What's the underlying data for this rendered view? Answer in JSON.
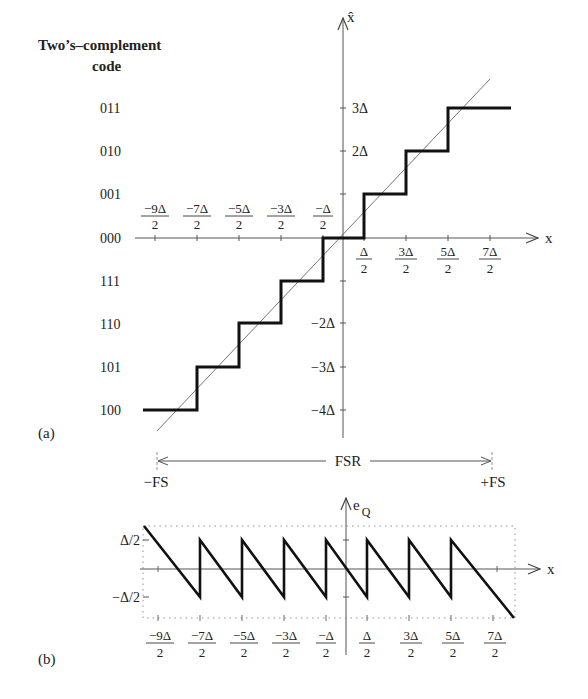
{
  "panel_a": {
    "label": "(a)",
    "title_line1": "Two’s–complement",
    "title_line2": "code",
    "y_axis_label": "x̂",
    "x_axis_label": "x",
    "codes": [
      "011",
      "010",
      "001",
      "000",
      "111",
      "110",
      "101",
      "100"
    ],
    "y_ticks_pos": [
      "3Δ",
      "2Δ"
    ],
    "y_ticks_neg": [
      "−2Δ",
      "−3Δ",
      "−4Δ"
    ],
    "x_ticks_neg": [
      {
        "num": "−9Δ",
        "den": "2"
      },
      {
        "num": "−7Δ",
        "den": "2"
      },
      {
        "num": "−5Δ",
        "den": "2"
      },
      {
        "num": "−3Δ",
        "den": "2"
      },
      {
        "num": "−Δ",
        "den": "2"
      }
    ],
    "x_ticks_pos": [
      {
        "num": "Δ",
        "den": "2"
      },
      {
        "num": "3Δ",
        "den": "2"
      },
      {
        "num": "5Δ",
        "den": "2"
      },
      {
        "num": "7Δ",
        "den": "2"
      }
    ]
  },
  "range": {
    "fsr_label": "FSR",
    "neg_label": "−FS",
    "pos_label": "+FS"
  },
  "panel_b": {
    "label": "(b)",
    "y_axis_label_main": "e",
    "y_axis_label_sub": "Q",
    "x_axis_label": "x",
    "y_tick_pos": "Δ/2",
    "y_tick_neg": "−Δ/2",
    "x_ticks": [
      {
        "num": "−9Δ",
        "den": "2"
      },
      {
        "num": "−7Δ",
        "den": "2"
      },
      {
        "num": "−5Δ",
        "den": "2"
      },
      {
        "num": "−3Δ",
        "den": "2"
      },
      {
        "num": "−Δ",
        "den": "2"
      },
      {
        "num": "Δ",
        "den": "2"
      },
      {
        "num": "3Δ",
        "den": "2"
      },
      {
        "num": "5Δ",
        "den": "2"
      },
      {
        "num": "7Δ",
        "den": "2"
      }
    ]
  }
}
